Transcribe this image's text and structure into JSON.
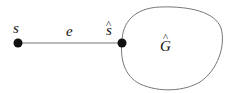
{
  "diagram": {
    "nodes": [
      {
        "id": "s",
        "label": "s"
      },
      {
        "id": "s_hat",
        "label": "s",
        "hat": "^"
      }
    ],
    "edge": {
      "label": "e",
      "from": "s",
      "to": "s_hat"
    },
    "region": {
      "label": "G",
      "hat": "^"
    },
    "colors": {
      "node": "#111111",
      "line": "#666666",
      "text": "#111111"
    }
  }
}
